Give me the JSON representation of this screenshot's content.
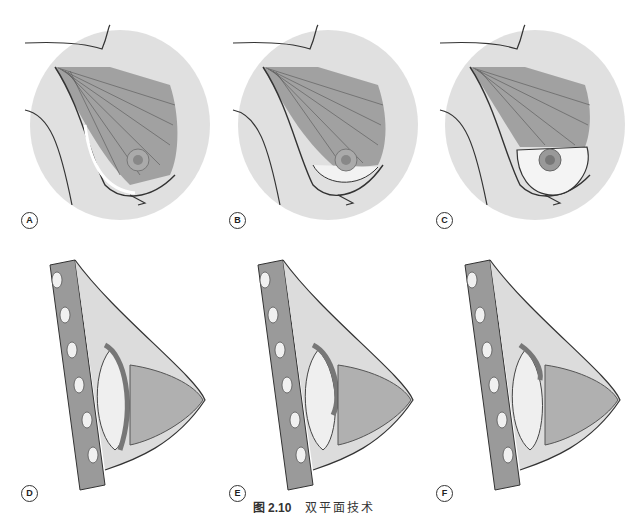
{
  "figure": {
    "caption_number": "图 2.10",
    "caption_text": "双平面技术"
  },
  "panels": [
    {
      "id": "A",
      "label": "A",
      "view": "frontal",
      "variant": "dual-plane-type-1"
    },
    {
      "id": "B",
      "label": "B",
      "view": "frontal",
      "variant": "dual-plane-type-2"
    },
    {
      "id": "C",
      "label": "C",
      "view": "frontal",
      "variant": "dual-plane-type-3"
    },
    {
      "id": "D",
      "label": "D",
      "view": "sagittal",
      "variant": "dual-plane-type-1"
    },
    {
      "id": "E",
      "label": "E",
      "view": "sagittal",
      "variant": "dual-plane-type-2"
    },
    {
      "id": "F",
      "label": "F",
      "view": "sagittal",
      "variant": "dual-plane-type-3"
    }
  ],
  "colors": {
    "skin": "#d4d4d4",
    "muscle": "#8c8c8c",
    "implant": "#efefef",
    "gland": "#b0b0b0",
    "outline": "#333333"
  }
}
